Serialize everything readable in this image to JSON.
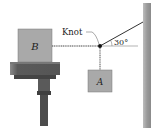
{
  "diagram": {
    "labels": {
      "block_b": "B",
      "block_a": "A",
      "knot": "Knot",
      "angle": "30°"
    },
    "angle_degrees": 30,
    "colors": {
      "block_fill": "#a9a9a9",
      "block_stroke": "#6e6e6e",
      "table_top": "#5a5a5a",
      "table_leg": "#4a4a4a",
      "wall_fill": "#9a9a9a",
      "rope": "#333333",
      "knot": "#111111"
    }
  }
}
